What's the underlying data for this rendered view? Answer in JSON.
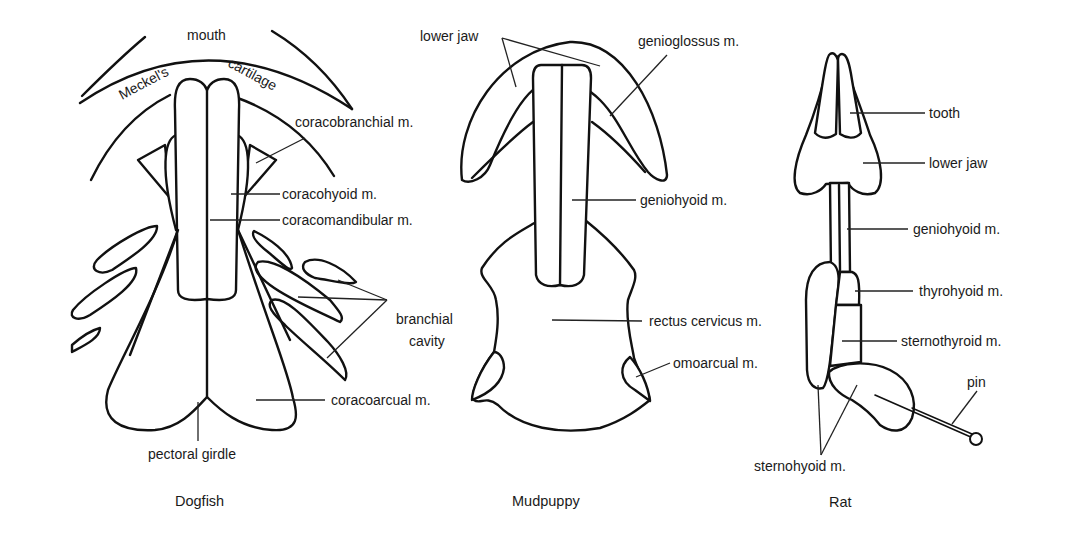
{
  "figure": {
    "panels": [
      {
        "name": "Dogfish",
        "caption": "Dogfish",
        "labels": {
          "mouth": "mouth",
          "meckels": "Meckel's",
          "cartilage": "cartilage",
          "coracobranchial": "coracobranchial m.",
          "coracohyoid": "coracohyoid m.",
          "coracomandibular": "coracomandibular m.",
          "branchial_1": "branchial",
          "branchial_2": "cavity",
          "coracoarcual": "coracoarcual m.",
          "pectoral_girdle": "pectoral girdle"
        }
      },
      {
        "name": "Mudpuppy",
        "caption": "Mudpuppy",
        "labels": {
          "lower_jaw": "lower jaw",
          "genioglossus": "genioglossus m.",
          "geniohyoid": "geniohyoid m.",
          "rectus_cervicus": "rectus cervicus m.",
          "omoarcual": "omoarcual m."
        }
      },
      {
        "name": "Rat",
        "caption": "Rat",
        "labels": {
          "tooth": "tooth",
          "lower_jaw": "lower jaw",
          "geniohyoid": "geniohyoid m.",
          "thyrohyoid": "thyrohyoid m.",
          "sternothyroid": "sternothyroid m.",
          "pin": "pin",
          "sternohyoid": "sternohyoid m."
        }
      }
    ],
    "colors": {
      "line": "#111111",
      "text": "#1a1a1a",
      "background": "#ffffff"
    }
  }
}
